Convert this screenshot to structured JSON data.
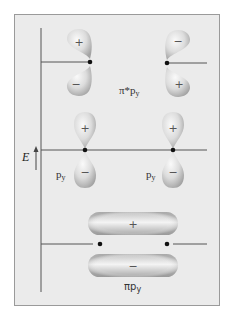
{
  "figure": {
    "axis_label": "E",
    "levels": [
      {
        "id": "pi-star",
        "label_main": "π*p",
        "label_sub": "y",
        "description": "antibonding pi orbital",
        "left_lobes": {
          "top_sign": "+",
          "bottom_sign": "−"
        },
        "right_lobes": {
          "top_sign": "−",
          "bottom_sign": "+"
        }
      },
      {
        "id": "atomic-p",
        "left_label_main": "p",
        "left_label_sub": "y",
        "right_label_main": "p",
        "right_label_sub": "y",
        "left_lobes": {
          "top_sign": "+",
          "bottom_sign": "−"
        },
        "right_lobes": {
          "top_sign": "+",
          "bottom_sign": "−"
        }
      },
      {
        "id": "pi-bonding",
        "label_main": "πp",
        "label_sub": "y",
        "description": "bonding pi orbital",
        "top_lobe_sign": "+",
        "bottom_lobe_sign": "−"
      }
    ]
  },
  "colors": {
    "background": "#ebebeb",
    "border": "#9a9a9a",
    "line": "#555555",
    "lobe_light": "#f7f7f7",
    "lobe_dark": "#a8a8a8",
    "nucleus": "#111111"
  }
}
